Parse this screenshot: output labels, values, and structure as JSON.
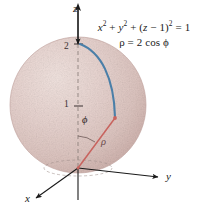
{
  "figure": {
    "background_color": "#ffffff",
    "equations": [
      {
        "id": "cartesian",
        "text": "x² + y² + (z − 1)² = 1"
      },
      {
        "id": "spherical",
        "text": "ρ = 2 cos ϕ"
      }
    ],
    "axes": [
      {
        "id": "z",
        "label": "z",
        "direction": "up"
      },
      {
        "id": "y",
        "label": "y",
        "direction": "right"
      },
      {
        "id": "x",
        "label": "x",
        "direction": "down-left"
      }
    ],
    "ticks": [
      {
        "id": "two",
        "label": "2",
        "axis": "z",
        "value": 2
      },
      {
        "id": "one",
        "label": "1",
        "axis": "z",
        "value": 1
      }
    ],
    "annotations": [
      {
        "id": "phi",
        "label": "ϕ",
        "kind": "angle"
      },
      {
        "id": "rho",
        "label": "ρ",
        "kind": "radius"
      }
    ],
    "colors": {
      "sphere_fill": "#e3cfcb",
      "sphere_edge": "#c3a9a5",
      "arc_blue": "#4a7fa8",
      "ray_red": "#c8635e",
      "axis_black": "#1a1a1a",
      "dashed_gray": "#8a7d7a"
    },
    "geometry": {
      "sphere_center": [
        78,
        105
      ],
      "sphere_radius": 68,
      "origin": [
        78,
        168
      ],
      "point_on_sphere": [
        115,
        118
      ]
    }
  }
}
